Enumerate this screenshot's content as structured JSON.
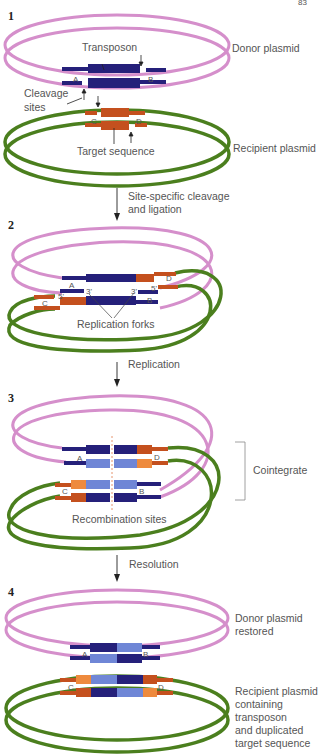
{
  "page_number": "83",
  "colors": {
    "donor": "#d58fcb",
    "recipient": "#4b7f1e",
    "transposon_dark": "#25207a",
    "transposon_light": "#6f86d6",
    "target_dark": "#c4501e",
    "target_light": "#ee8a3d",
    "arrow": "#222222",
    "recomb_line": "#e07a4a"
  },
  "steps": [
    {
      "number": "1",
      "labels": {
        "transposon": "Transposon",
        "donor": "Donor plasmid",
        "cleavage": [
          "Cleavage",
          "sites"
        ],
        "target": "Target sequence",
        "recipient": "Recipient plasmid",
        "site_a": "A",
        "site_b": "B",
        "site_c": "C",
        "site_d": "D"
      }
    },
    {
      "number": "2",
      "transition": [
        "Site-specific cleavage",
        "and ligation"
      ],
      "labels": {
        "forks": "Replication forks",
        "three_prime": "3'",
        "five_prime": "5'",
        "site_a": "A",
        "site_b": "B",
        "site_c": "C",
        "site_d": "D"
      }
    },
    {
      "number": "3",
      "transition": [
        "Replication"
      ],
      "labels": {
        "cointegrate": "Cointegrate",
        "recomb": "Recombination sites",
        "site_a": "A",
        "site_b": "B",
        "site_c": "C",
        "site_d": "D"
      }
    },
    {
      "number": "4",
      "transition": [
        "Resolution"
      ],
      "labels": {
        "donor_restored": [
          "Donor plasmid",
          "restored"
        ],
        "recipient_final": [
          "Recipient plasmid",
          "containing",
          "transposon",
          "and duplicated",
          "target sequence"
        ],
        "site_a": "A",
        "site_b": "B",
        "site_c": "C",
        "site_d": "D"
      }
    }
  ]
}
